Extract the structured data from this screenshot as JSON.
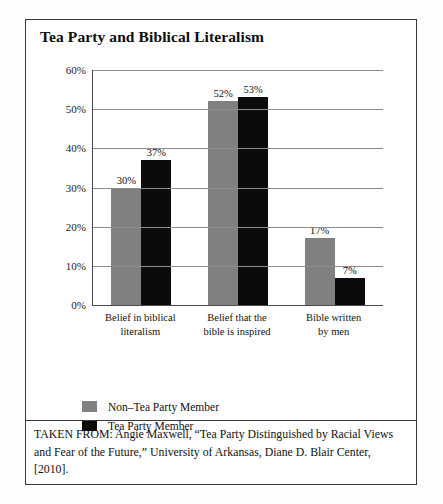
{
  "figure": {
    "title": "Tea Party and Biblical Literalism",
    "caption": "TAKEN FROM: Angie Maxwell, “Tea Party Distinguished by Racial Views and Fear of the Future,” University of Arkansas, Diane D. Blair Center, [2010]."
  },
  "chart_data": {
    "type": "bar",
    "title": "Tea Party and Biblical Literalism",
    "xlabel": "",
    "ylabel": "",
    "ylim": [
      0,
      60
    ],
    "ytick_labels": [
      "0%",
      "10%",
      "20%",
      "30%",
      "40%",
      "50%",
      "60%"
    ],
    "ytick_values": [
      0,
      10,
      20,
      30,
      40,
      50,
      60
    ],
    "grid": true,
    "legend_position": "bottom-left",
    "categories": [
      "Belief in biblical literalism",
      "Belief that the bible is inspired",
      "Bible written by men"
    ],
    "category_lines": [
      [
        "Belief in biblical",
        "literalism"
      ],
      [
        "Belief that the",
        "bible is inspired"
      ],
      [
        "Bible written",
        "by men"
      ]
    ],
    "series": [
      {
        "name": "Non–Tea Party Member",
        "color": "#808080",
        "values": [
          30,
          52,
          17
        ],
        "value_labels": [
          "30%",
          "52%",
          "17%"
        ]
      },
      {
        "name": "Tea Party Member",
        "color": "#0b0b0b",
        "values": [
          37,
          53,
          7
        ],
        "value_labels": [
          "37%",
          "53%",
          "7%"
        ]
      }
    ]
  }
}
